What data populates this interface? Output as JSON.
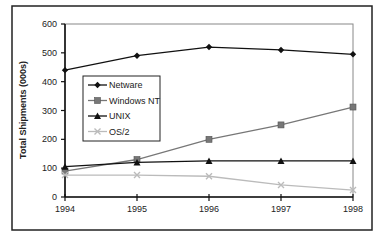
{
  "chart_data": {
    "type": "line",
    "title": "",
    "xlabel": "",
    "ylabel": "Total Shipments (000s)",
    "x": [
      "1994",
      "1995",
      "1996",
      "1997",
      "1998"
    ],
    "ylim": [
      0,
      600
    ],
    "yticks": [
      0,
      100,
      200,
      300,
      400,
      500,
      600
    ],
    "grid": false,
    "legend_position": "inside-left",
    "series": [
      {
        "name": "Netware",
        "values": [
          440,
          490,
          520,
          510,
          495
        ],
        "color": "#111111",
        "marker": "diamond"
      },
      {
        "name": "Windows NT",
        "values": [
          90,
          130,
          200,
          250,
          312
        ],
        "color": "#777777",
        "marker": "square"
      },
      {
        "name": "UNIX",
        "values": [
          105,
          120,
          125,
          125,
          125
        ],
        "color": "#111111",
        "marker": "triangle"
      },
      {
        "name": "OS/2",
        "values": [
          76,
          76,
          72,
          42,
          24
        ],
        "color": "#bbbbbb",
        "marker": "x"
      }
    ]
  }
}
